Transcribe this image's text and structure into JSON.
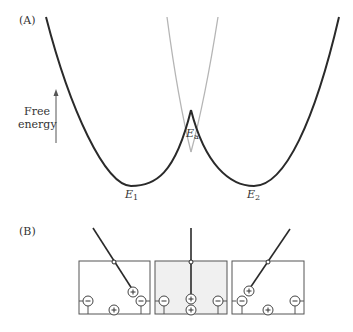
{
  "panel_a": {
    "label": "(A)",
    "y_axis_label_line1": "Free",
    "y_axis_label_line2": "energy",
    "minima": [
      {
        "name": "E",
        "sub": "1"
      },
      {
        "name": "E",
        "sub": "2"
      }
    ],
    "barrier": {
      "name": "E",
      "sub": "a"
    },
    "colors": {
      "curve": "#2a2a2a",
      "continuation": "#b0b0b0",
      "arrow": "#555555"
    }
  },
  "panel_b": {
    "label": "(B)",
    "states": [
      {
        "name": "state-1",
        "shaded": false,
        "lever": "tilted-left"
      },
      {
        "name": "transition",
        "shaded": true,
        "lever": "vertical"
      },
      {
        "name": "state-2",
        "shaded": false,
        "lever": "tilted-right"
      }
    ],
    "charge_plus": "+",
    "charge_minus": "−",
    "colors": {
      "box_border": "#555555",
      "shaded_fill": "#f0f0f0",
      "lever": "#2a2a2a"
    }
  }
}
